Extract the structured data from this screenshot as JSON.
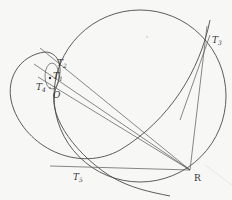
{
  "diagram": {
    "type": "geometric construction",
    "colors": {
      "background": "#f7f7f5",
      "line": "#4a4a4a",
      "text": "#333333"
    },
    "points": [
      {
        "id": "T2",
        "label": "T",
        "sub": "2",
        "x": 55,
        "y": 60
      },
      {
        "id": "T1",
        "label": "T",
        "sub": "1",
        "x": 51,
        "y": 76
      },
      {
        "id": "T4",
        "label": "T",
        "sub": "4",
        "x": 48,
        "y": 83
      },
      {
        "id": "O",
        "label": "O",
        "sub": "",
        "x": 52,
        "y": 90
      },
      {
        "id": "T3",
        "label": "T",
        "sub": "3",
        "x": 207,
        "y": 40
      },
      {
        "id": "T5",
        "label": "T",
        "sub": "5",
        "x": 82,
        "y": 166
      },
      {
        "id": "R",
        "label": "R",
        "sub": "",
        "x": 190,
        "y": 170
      }
    ],
    "labels": {
      "T2": "T",
      "T2_sub": "2",
      "T1": "T",
      "T1_sub": "1",
      "T4": "T",
      "T4_sub": "4",
      "O": "O",
      "T3": "T",
      "T3_sub": "3",
      "T5": "T",
      "T5_sub": "5",
      "R": "R"
    },
    "shapes": [
      {
        "name": "large-circle",
        "cx": 140,
        "cy": 96,
        "r": 86
      },
      {
        "name": "small-circle",
        "cx": 53,
        "cy": 76,
        "r": 9
      },
      {
        "name": "left-loop-curve"
      },
      {
        "name": "lines-from-R",
        "targets": [
          "T2",
          "T1",
          "T4",
          "T3",
          "T5"
        ]
      }
    ]
  }
}
